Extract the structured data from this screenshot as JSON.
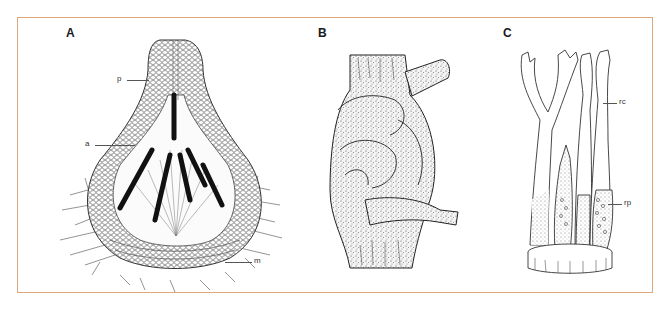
{
  "figure": {
    "border_color": "#e0a87a",
    "panels": [
      {
        "id": "A",
        "label": "A",
        "annotations": [
          {
            "key": "p",
            "text": "p"
          },
          {
            "key": "a",
            "text": "a"
          },
          {
            "key": "m",
            "text": "m"
          }
        ]
      },
      {
        "id": "B",
        "label": "B",
        "annotations": []
      },
      {
        "id": "C",
        "label": "C",
        "annotations": [
          {
            "key": "rc",
            "text": "rc"
          },
          {
            "key": "rp",
            "text": "rp"
          }
        ]
      }
    ]
  }
}
